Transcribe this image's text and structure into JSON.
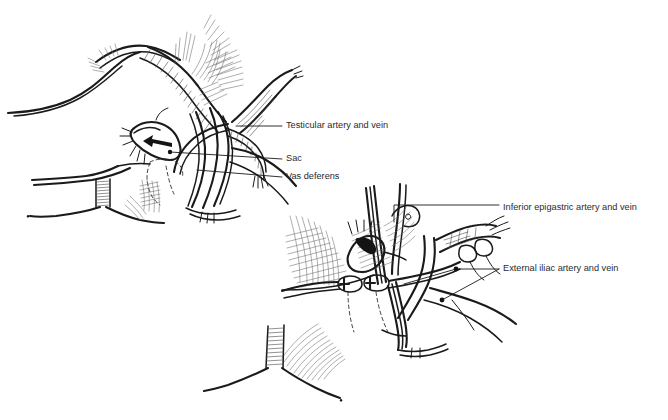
{
  "figure": {
    "background_color": "#ffffff",
    "ink_color": "#1a1a1a",
    "text_color": "#2b2b2b",
    "width": 668,
    "height": 420,
    "panels": [
      {
        "id": "upper-panel",
        "name": "upper-anatomical-drawing",
        "description": "Indirect inguinal hernia view with sac retracted by arrow"
      },
      {
        "id": "lower-panel",
        "name": "lower-anatomical-drawing",
        "description": "Deeper dissection view showing iliac and epigastric vessels with clips"
      }
    ],
    "labels": [
      {
        "id": "testicular",
        "text": "Testicular artery and vein",
        "text_x": 286,
        "text_y": 126,
        "leader": "M 236 126 L 282 126",
        "panel": "upper-panel"
      },
      {
        "id": "sac",
        "text": "Sac",
        "text_x": 286,
        "text_y": 159,
        "leader": "M 170 152 L 282 159",
        "panel": "upper-panel",
        "dot": {
          "x": 170,
          "y": 152
        }
      },
      {
        "id": "vas-deferens",
        "text": "Vas deferens",
        "text_x": 286,
        "text_y": 177,
        "leader": "M 197 170 L 282 177",
        "panel": "upper-panel"
      },
      {
        "id": "inferior-epigastric",
        "text": "Inferior epigastric artery and vein",
        "text_x": 503,
        "text_y": 208,
        "leader": "M 394 222 L 394 205 L 499 205",
        "panel": "lower-panel"
      },
      {
        "id": "external-iliac",
        "text": "External iliac artery and vein",
        "text_x": 503,
        "text_y": 269,
        "leader1": "M 458 269 L 499 269",
        "leader2": "M 458 269 L 400 287",
        "leader3": "M 458 269 L 442 302",
        "panel": "lower-panel",
        "dot1": {
          "x": 456,
          "y": 269
        },
        "dot2": {
          "x": 442,
          "y": 300
        }
      }
    ]
  }
}
